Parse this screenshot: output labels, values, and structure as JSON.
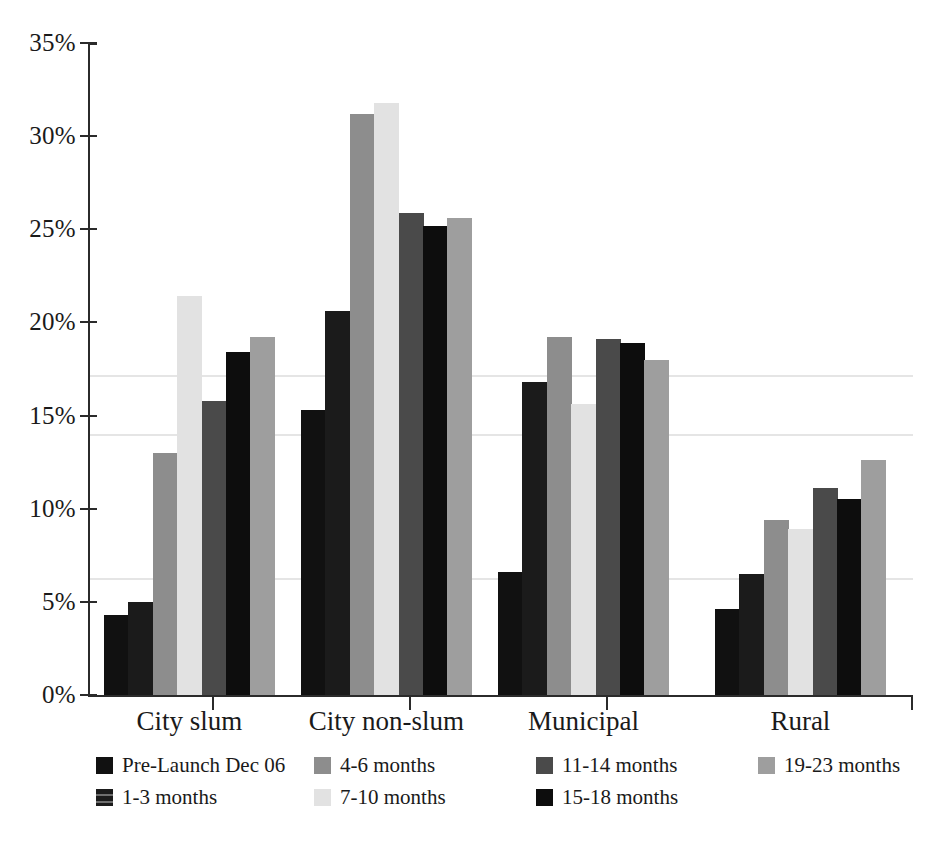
{
  "chart_data": {
    "type": "bar",
    "title": "",
    "subtitle": "",
    "xlabel": "",
    "ylabel": "",
    "categories": [
      "City slum",
      "City non-slum",
      "Municipal",
      "Rural"
    ],
    "ylim": [
      0,
      35
    ],
    "y_tick_labels": [
      "0%",
      "5%",
      "10%",
      "15%",
      "20%",
      "25%",
      "30%",
      "35%"
    ],
    "y_ticks": [
      0,
      5,
      10,
      15,
      20,
      25,
      30,
      35
    ],
    "y_unit": "%",
    "grid": false,
    "legend_position": "bottom",
    "series": [
      {
        "name": "Pre-Launch Dec 06",
        "color": "#111111",
        "values": [
          4.3,
          15.3,
          6.6,
          4.6
        ]
      },
      {
        "name": "1-3 months",
        "color": "#1b1b1b",
        "values": [
          5.0,
          20.6,
          16.8,
          6.5
        ]
      },
      {
        "name": "4-6 months",
        "color": "#8d8d8d",
        "values": [
          13.0,
          31.2,
          19.2,
          9.4
        ]
      },
      {
        "name": "7-10 months",
        "color": "#e2e2e2",
        "values": [
          21.4,
          31.8,
          15.6,
          8.9
        ]
      },
      {
        "name": "11-14 months",
        "color": "#4a4a4a",
        "values": [
          15.8,
          25.9,
          19.1,
          11.1
        ]
      },
      {
        "name": "15-18 months",
        "color": "#0d0d0d",
        "values": [
          18.4,
          25.2,
          18.9,
          10.5
        ]
      },
      {
        "name": "19-23 months",
        "color": "#9e9e9e",
        "values": [
          19.2,
          25.6,
          18.0,
          12.6
        ]
      }
    ]
  },
  "axis": {
    "y_labels": [
      "35%",
      "30%",
      "25%",
      "20%",
      "15%",
      "10%",
      "5%",
      "0%"
    ],
    "x_labels": [
      "City slum",
      "City non-slum",
      "Municipal",
      "Rural"
    ]
  },
  "legend": {
    "items": [
      {
        "label": "Pre-Launch Dec 06",
        "color": "#111111"
      },
      {
        "label": "1-3 months",
        "color": "#1b1b1b"
      },
      {
        "label": "4-6 months",
        "color": "#8d8d8d"
      },
      {
        "label": "7-10 months",
        "color": "#e2e2e2"
      },
      {
        "label": "11-14 months",
        "color": "#4a4a4a"
      },
      {
        "label": "15-18 months",
        "color": "#0d0d0d"
      },
      {
        "label": "19-23 months",
        "color": "#9e9e9e"
      }
    ]
  }
}
